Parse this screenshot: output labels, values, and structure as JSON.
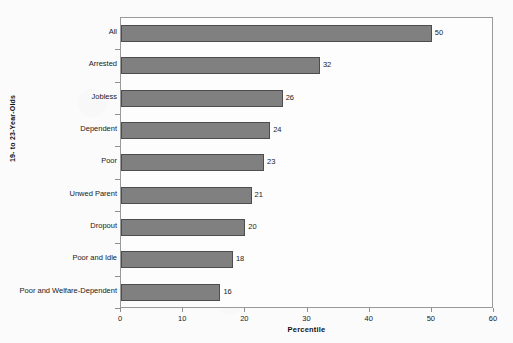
{
  "chart_data": {
    "type": "bar",
    "orientation": "horizontal",
    "title": "",
    "subtitle": "",
    "xlabel": "Percentile",
    "ylabel": "19- to 23-Year-Olds",
    "xlim": [
      0,
      60
    ],
    "xticks": [
      0,
      10,
      20,
      30,
      40,
      50,
      60
    ],
    "xtick_labels": [
      "0",
      "10",
      "20",
      "30",
      "40",
      "50",
      "60"
    ],
    "grid": false,
    "legend": null,
    "categories": [
      "All",
      "Arrested",
      "Jobless",
      "Dependent",
      "Poor",
      "Unwed Parent",
      "Dropout",
      "Poor and Idle",
      "Poor and Welfare-Dependent"
    ],
    "values": [
      50,
      32,
      26,
      24,
      23,
      21,
      20,
      18,
      16
    ],
    "value_labels": [
      "50",
      "32",
      "26",
      "24",
      "23",
      "21",
      "20",
      "18",
      "16"
    ],
    "colors": {
      "bar_fill": "#808080",
      "bar_border": "#4d4d4d",
      "plot_background": "#fdfdfd",
      "page_background": "#fbfbfb",
      "axis_line": "#9a9a9a",
      "text": "#1a1a1a"
    }
  }
}
